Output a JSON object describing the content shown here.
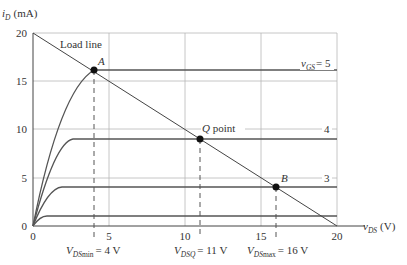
{
  "diagram": {
    "y_axis_label_main": "i",
    "y_axis_label_sub": "D",
    "y_axis_label_units": "(mA)",
    "x_axis_label_main": "v",
    "x_axis_label_sub": "DS",
    "x_axis_label_units": "(V)",
    "x_ticks": [
      "0",
      "5",
      "10",
      "15",
      "20"
    ],
    "y_ticks": [
      "0",
      "5",
      "10",
      "15",
      "20"
    ],
    "load_line_label": "Load line",
    "curves": [
      {
        "label_main": "v",
        "label_sub": "GS",
        "label_value": "= 5",
        "saturation_mA": 16.2
      },
      {
        "label": "4",
        "saturation_mA": 9
      },
      {
        "label": "3",
        "saturation_mA": 4
      },
      {
        "label": "",
        "saturation_mA": 1
      }
    ],
    "points": {
      "A": {
        "label": "A",
        "vds": 4,
        "id": 16.2
      },
      "Q": {
        "label": "Q",
        "suffix": " point",
        "vds": 11,
        "id": 9
      },
      "B": {
        "label": "B",
        "vds": 16,
        "id": 4
      }
    },
    "annotations": {
      "vds_min": {
        "main": "V",
        "sub": "DS",
        "sub2": "min",
        "value": "= 4 V"
      },
      "vdsq": {
        "main": "V",
        "sub": "DSQ",
        "value": "= 11 V"
      },
      "vds_max": {
        "main": "V",
        "sub": "DS",
        "sub2": "max",
        "value": "= 16 V"
      }
    }
  }
}
